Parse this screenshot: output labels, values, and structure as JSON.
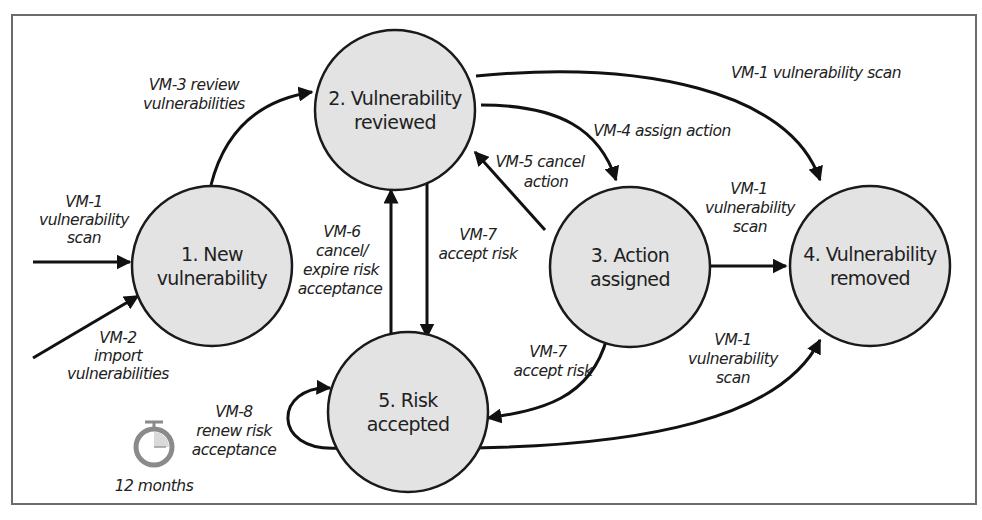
{
  "diagram": {
    "type": "state-transition",
    "colors": {
      "node_fill": "#e3e3e3",
      "node_stroke": "#1a1a1a",
      "edge": "#111111",
      "frame": "#6b6b6b",
      "timer": "#8a8a8a"
    },
    "nodes": [
      {
        "id": "1",
        "line1": "1. New",
        "line2": "vulnerability"
      },
      {
        "id": "2",
        "line1": "2. Vulnerability",
        "line2": "reviewed"
      },
      {
        "id": "3",
        "line1": "3. Action",
        "line2": "assigned"
      },
      {
        "id": "4",
        "line1": "4. Vulnerability",
        "line2": "removed"
      },
      {
        "id": "5",
        "line1": "5. Risk",
        "line2": "accepted"
      }
    ],
    "edges": [
      {
        "from": "external",
        "to": "1",
        "lines": [
          "VM-1",
          "vulnerability",
          "scan"
        ]
      },
      {
        "from": "external",
        "to": "1",
        "lines": [
          "VM-2",
          "import",
          "vulnerabilities"
        ]
      },
      {
        "from": "1",
        "to": "2",
        "lines": [
          "VM-3 review",
          "vulnerabilities"
        ]
      },
      {
        "from": "2",
        "to": "4",
        "lines": [
          "VM-1 vulnerability scan"
        ]
      },
      {
        "from": "2",
        "to": "3",
        "lines": [
          "VM-4 assign action"
        ]
      },
      {
        "from": "3",
        "to": "2",
        "lines": [
          "VM-5 cancel",
          "action"
        ]
      },
      {
        "from": "5",
        "to": "2",
        "lines": [
          "VM-6",
          "cancel/",
          "expire risk",
          "acceptance"
        ]
      },
      {
        "from": "2",
        "to": "5",
        "lines": [
          "VM-7",
          "accept risk"
        ]
      },
      {
        "from": "3",
        "to": "4",
        "lines": [
          "VM-1",
          "vulnerability",
          "scan"
        ]
      },
      {
        "from": "3",
        "to": "5",
        "lines": [
          "VM-7",
          "accept risk"
        ]
      },
      {
        "from": "5",
        "to": "4",
        "lines": [
          "VM-1",
          "vulnerability",
          "scan"
        ]
      },
      {
        "from": "5",
        "to": "5",
        "lines": [
          "VM-8",
          "renew risk",
          "acceptance"
        ]
      }
    ],
    "timer": {
      "icon": "stopwatch-icon",
      "label": "12 months"
    }
  }
}
